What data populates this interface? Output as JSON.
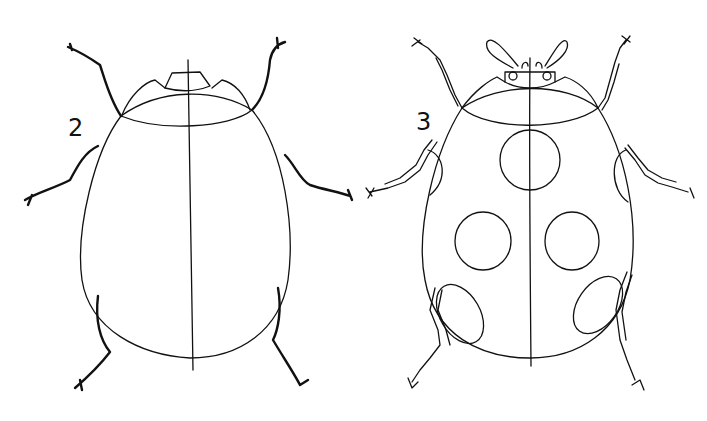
{
  "illustration": {
    "subject": "ladybug drawing steps",
    "steps": [
      {
        "label": "2",
        "description": "body outline with head, pronotum and simple legs"
      },
      {
        "label": "3",
        "description": "detailed ladybug with segmented legs, antennae and spots"
      }
    ],
    "colors": {
      "line": "#111111",
      "background": "#ffffff"
    }
  }
}
